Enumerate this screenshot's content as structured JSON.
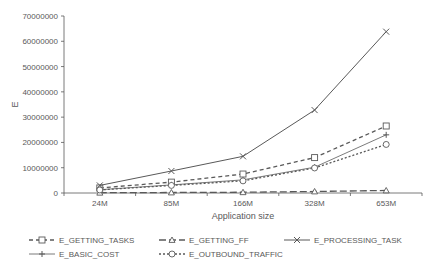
{
  "chart_data": {
    "type": "line",
    "title": "",
    "xlabel": "Application size",
    "ylabel": "E",
    "ylim": [
      0,
      70000000
    ],
    "yticks": [
      0,
      10000000,
      20000000,
      30000000,
      40000000,
      50000000,
      60000000,
      70000000
    ],
    "grid": false,
    "legend_position": "bottom",
    "categories": [
      "24M",
      "85M",
      "166M",
      "328M",
      "653M"
    ],
    "series": [
      {
        "name": "E_GETTING_TASKS",
        "marker": "square",
        "dash": "4,3",
        "width": 1.3,
        "values": [
          2000000,
          4300000,
          7500000,
          14000000,
          26500000
        ]
      },
      {
        "name": "E_GETTING_FF",
        "marker": "triangle",
        "dash": "7,3",
        "width": 1.3,
        "values": [
          100000,
          200000,
          300000,
          600000,
          1000000
        ]
      },
      {
        "name": "E_PROCESSING_TASK",
        "marker": "x",
        "dash": "",
        "width": 1,
        "values": [
          3000000,
          8700000,
          14500000,
          32800000,
          63800000
        ]
      },
      {
        "name": "E_BASIC_COST",
        "marker": "plus",
        "dash": "",
        "width": 0.8,
        "values": [
          1300000,
          3200000,
          5200000,
          10200000,
          23000000
        ]
      },
      {
        "name": "E_OUTBOUND_TRAFFIC",
        "marker": "circle",
        "dash": "2,2",
        "width": 1.3,
        "values": [
          1200000,
          3000000,
          4800000,
          9900000,
          19200000
        ]
      }
    ]
  },
  "colors": {
    "line": "#595959",
    "axis": "#595959",
    "text": "#595959"
  }
}
